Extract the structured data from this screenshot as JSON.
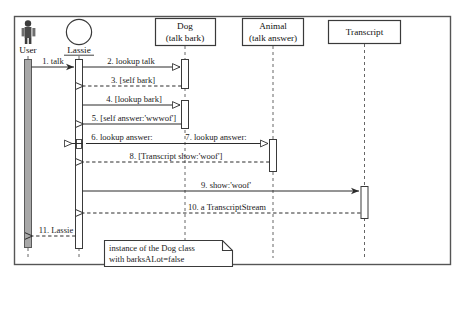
{
  "diagram": {
    "kind": "uml-sequence-diagram",
    "frame": {
      "border_color": "#555555",
      "background": "#ffffff"
    },
    "colors": {
      "line": "#2b2b2b",
      "dashed_lifeline": "#666666",
      "activation_fill": "#ffffff",
      "activation_stroke": "#3a3a3a",
      "actor_activation_fill": "#a8a8a8",
      "note_fill": "#ffffff",
      "text": "#1a1a1a"
    },
    "participants": [
      {
        "id": "user",
        "label": "User",
        "head_type": "actor-stick-figure",
        "underline": false,
        "x": 28
      },
      {
        "id": "lassie",
        "label": "Lassie",
        "head_type": "circle-instance",
        "underline": true,
        "x": 79
      },
      {
        "id": "dog",
        "label": "Dog",
        "sublabel": "(talk bark)",
        "head_type": "class-box",
        "underline": false,
        "x": 185
      },
      {
        "id": "animal",
        "label": "Animal",
        "sublabel": "(talk answer)",
        "head_type": "class-box",
        "underline": false,
        "x": 273
      },
      {
        "id": "transcript",
        "label": "Transcript",
        "sublabel": "",
        "head_type": "class-box",
        "underline": false,
        "x": 364
      }
    ],
    "messages": [
      {
        "seq": "1",
        "label": "1. talk",
        "from": "user",
        "to": "lassie",
        "style": "solid",
        "arrow": "solid-thin",
        "y": 67
      },
      {
        "seq": "2",
        "label": "2. lookup talk",
        "from": "lassie",
        "to": "dog",
        "style": "solid",
        "arrow": "open-triangle",
        "y": 67
      },
      {
        "seq": "3",
        "label": "3. [self bark]",
        "from": "dog",
        "to": "lassie",
        "style": "dashed",
        "arrow": "open-thin",
        "y": 86
      },
      {
        "seq": "4",
        "label": "4. [lookup bark]",
        "from": "lassie",
        "to": "dog",
        "style": "solid",
        "arrow": "open-triangle",
        "y": 105
      },
      {
        "seq": "5",
        "label": "5. [self answer:'wwwof']",
        "from": "dog",
        "to": "lassie",
        "style": "solid",
        "arrow": "open-thin",
        "y": 124
      },
      {
        "seq": "6",
        "label": "6. lookup answer:",
        "from": "lassie",
        "to": "lassie",
        "style": "solid",
        "arrow": "open-triangle",
        "y": 143
      },
      {
        "seq": "7",
        "label": "7. lookup answer:",
        "from": "lassie",
        "to": "dog",
        "style": "solid",
        "arrow": "open-triangle",
        "y": 143
      },
      {
        "seq": "8",
        "label": "8. [Transcript show:'woof']",
        "from": "dog",
        "to": "lassie",
        "style": "dashed",
        "arrow": "open-thin",
        "y": 162
      },
      {
        "seq": "9",
        "label": "9. show:'woof'",
        "from": "lassie",
        "to": "transcript",
        "style": "solid",
        "arrow": "solid-thin",
        "y": 191
      },
      {
        "seq": "10",
        "label": "10. a TranscriptStream",
        "from": "transcript",
        "to": "lassie",
        "style": "dashed",
        "arrow": "open-thin",
        "y": 213
      },
      {
        "seq": "11",
        "label": "11. Lassie",
        "from": "lassie",
        "to": "user",
        "style": "dashed",
        "arrow": "open-thin",
        "y": 236
      }
    ],
    "note": {
      "line1": "instance of the Dog class",
      "line2": "with barksALot=false"
    }
  }
}
